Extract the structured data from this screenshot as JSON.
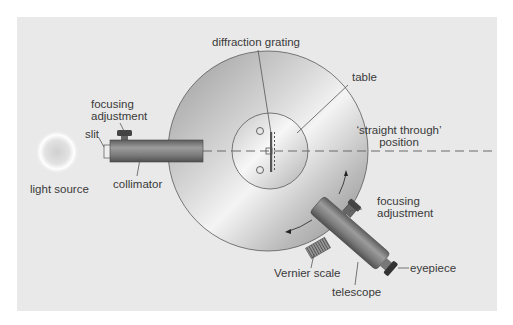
{
  "diagram": {
    "colors": {
      "panel": "#e9e9e9",
      "disc_light": "#f2f2f2",
      "disc_dark": "#8c8c8c",
      "tube": "#7a7a7a",
      "line": "#555555",
      "text": "#3a3a3a"
    },
    "labels": {
      "diffraction_grating": "diffraction grating",
      "table": "table",
      "focusing_adjustment_collimator_line1": "focusing",
      "focusing_adjustment_collimator_line2": "adjustment",
      "slit": "slit",
      "light_source": "light source",
      "collimator": "collimator",
      "straight_through_line1": "‘straight through’",
      "straight_through_line2": "position",
      "focusing_adjustment_telescope_line1": "focusing",
      "focusing_adjustment_telescope_line2": "adjustment",
      "vernier_scale": "Vernier scale",
      "telescope": "telescope",
      "eyepiece": "eyepiece"
    }
  }
}
